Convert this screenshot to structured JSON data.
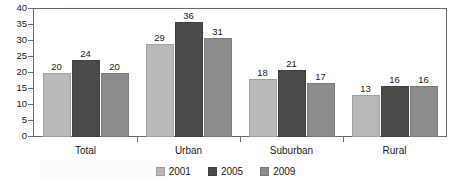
{
  "chart_data": {
    "type": "bar",
    "title": "",
    "subtitle": "",
    "xlabel": "",
    "ylabel": "",
    "categories": [
      "Total",
      "Urban",
      "Suburban",
      "Rural"
    ],
    "series": [
      {
        "name": "2001",
        "values": [
          20,
          29,
          18,
          13
        ],
        "color": "#b9b9b9"
      },
      {
        "name": "2005",
        "values": [
          24,
          36,
          21,
          16
        ],
        "color": "#4a4a4a"
      },
      {
        "name": "2009",
        "values": [
          20,
          31,
          17,
          16
        ],
        "color": "#8c8c8c"
      }
    ],
    "ylim": [
      0,
      40
    ],
    "yticks": [
      0,
      5,
      10,
      15,
      20,
      25,
      30,
      35,
      40
    ],
    "ytick_labels": [
      "0",
      "5",
      "10",
      "15",
      "20",
      "25",
      "30",
      "35",
      "40"
    ],
    "grid": false,
    "legend_position": "bottom",
    "data_labels": true,
    "frame": true
  },
  "legend": {
    "items": [
      {
        "label": "2001",
        "color": "#b9b9b9"
      },
      {
        "label": "2005",
        "color": "#4a4a4a"
      },
      {
        "label": "2009",
        "color": "#8c8c8c"
      }
    ]
  },
  "colors": {
    "axis": "#6b6b6b",
    "text": "#1a1a1a",
    "background": "#ffffff"
  }
}
